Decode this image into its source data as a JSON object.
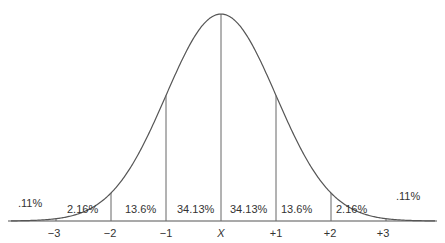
{
  "chart_data": {
    "type": "line",
    "title": "",
    "xlabel": "",
    "ylabel": "",
    "x_ticks": [
      "−3",
      "−2",
      "−1",
      "X",
      "+1",
      "+2",
      "+3"
    ],
    "x_sd": [
      -3,
      -2,
      -1,
      0,
      1,
      2,
      3
    ],
    "bands": [
      {
        "range": "< −3",
        "percent": ".11%"
      },
      {
        "range": "−3 to −2",
        "percent": "2.16%"
      },
      {
        "range": "−2 to −1",
        "percent": "13.6%"
      },
      {
        "range": "−1 to X",
        "percent": "34.13%"
      },
      {
        "range": "X to +1",
        "percent": "34.13%"
      },
      {
        "range": "+1 to +2",
        "percent": "13.6%"
      },
      {
        "range": "+2 to +3",
        "percent": "2.16%"
      },
      {
        "range": "> +3",
        "percent": ".11%"
      }
    ],
    "values": [
      0.11,
      2.16,
      13.6,
      34.13,
      34.13,
      13.6,
      2.16,
      0.11
    ],
    "grid": false,
    "legend": null,
    "colors": {
      "line": "#555555",
      "text": "#333333",
      "background": "#ffffff"
    }
  }
}
